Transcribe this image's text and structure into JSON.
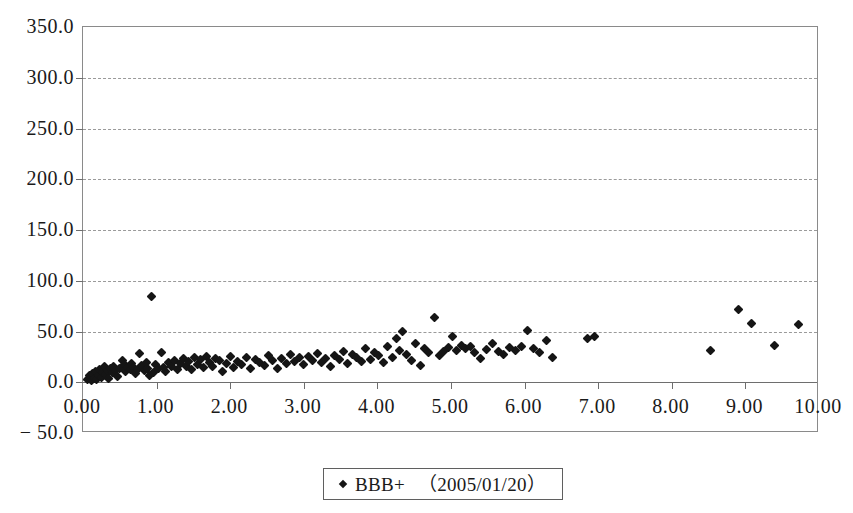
{
  "chart_data": {
    "type": "scatter",
    "title": "",
    "xlabel": "",
    "ylabel": "",
    "xlim": [
      0.0,
      10.0
    ],
    "ylim": [
      -50.0,
      350.0
    ],
    "grid": true,
    "grid_axis": "y",
    "legend_position": "bottom-center",
    "x_ticks": [
      "0.00",
      "1.00",
      "2.00",
      "3.00",
      "4.00",
      "5.00",
      "6.00",
      "7.00",
      "8.00",
      "9.00",
      "10.00"
    ],
    "x_tick_values": [
      0,
      1,
      2,
      3,
      4,
      5,
      6,
      7,
      8,
      9,
      10
    ],
    "y_ticks": [
      "350.0",
      "300.0",
      "250.0",
      "200.0",
      "150.0",
      "100.0",
      "50.0",
      "0.0",
      "− 50.0"
    ],
    "y_tick_values": [
      350,
      300,
      250,
      200,
      150,
      100,
      50,
      0,
      -50
    ],
    "series": [
      {
        "name": "BBB+",
        "date": "（2005/01/20）",
        "marker": "diamond",
        "color": "#151515",
        "points": [
          [
            0.06,
            3.0
          ],
          [
            0.09,
            6.5
          ],
          [
            0.11,
            1.5
          ],
          [
            0.13,
            9.0
          ],
          [
            0.15,
            4.0
          ],
          [
            0.17,
            11.0
          ],
          [
            0.19,
            2.5
          ],
          [
            0.21,
            7.0
          ],
          [
            0.23,
            13.0
          ],
          [
            0.25,
            5.0
          ],
          [
            0.27,
            10.0
          ],
          [
            0.29,
            15.5
          ],
          [
            0.31,
            8.0
          ],
          [
            0.33,
            12.0
          ],
          [
            0.35,
            3.5
          ],
          [
            0.37,
            14.0
          ],
          [
            0.4,
            9.5
          ],
          [
            0.42,
            16.0
          ],
          [
            0.44,
            11.5
          ],
          [
            0.47,
            6.0
          ],
          [
            0.5,
            13.5
          ],
          [
            0.53,
            21.0
          ],
          [
            0.56,
            17.0
          ],
          [
            0.58,
            10.5
          ],
          [
            0.61,
            14.5
          ],
          [
            0.64,
            12.5
          ],
          [
            0.66,
            18.0
          ],
          [
            0.69,
            15.0
          ],
          [
            0.72,
            8.5
          ],
          [
            0.74,
            13.0
          ],
          [
            0.77,
            28.0
          ],
          [
            0.8,
            16.5
          ],
          [
            0.83,
            12.0
          ],
          [
            0.86,
            19.0
          ],
          [
            0.88,
            14.0
          ],
          [
            0.91,
            6.5
          ],
          [
            0.93,
            84.0
          ],
          [
            0.96,
            10.0
          ],
          [
            0.99,
            17.5
          ],
          [
            1.02,
            13.5
          ],
          [
            1.06,
            29.0
          ],
          [
            1.09,
            15.0
          ],
          [
            1.12,
            11.0
          ],
          [
            1.16,
            19.5
          ],
          [
            1.2,
            16.0
          ],
          [
            1.24,
            21.5
          ],
          [
            1.28,
            13.0
          ],
          [
            1.32,
            18.5
          ],
          [
            1.36,
            23.0
          ],
          [
            1.4,
            15.5
          ],
          [
            1.44,
            20.0
          ],
          [
            1.48,
            12.5
          ],
          [
            1.52,
            24.0
          ],
          [
            1.56,
            17.0
          ],
          [
            1.6,
            22.0
          ],
          [
            1.64,
            14.5
          ],
          [
            1.68,
            25.5
          ],
          [
            1.72,
            19.0
          ],
          [
            1.76,
            16.0
          ],
          [
            1.8,
            23.5
          ],
          [
            1.85,
            21.0
          ],
          [
            1.9,
            10.5
          ],
          [
            1.95,
            18.0
          ],
          [
            2.0,
            25.0
          ],
          [
            2.05,
            15.0
          ],
          [
            2.1,
            20.5
          ],
          [
            2.16,
            17.5
          ],
          [
            2.22,
            24.5
          ],
          [
            2.28,
            13.5
          ],
          [
            2.34,
            22.5
          ],
          [
            2.4,
            19.5
          ],
          [
            2.46,
            16.5
          ],
          [
            2.52,
            26.0
          ],
          [
            2.58,
            21.5
          ],
          [
            2.64,
            14.0
          ],
          [
            2.7,
            23.0
          ],
          [
            2.76,
            18.5
          ],
          [
            2.82,
            27.0
          ],
          [
            2.88,
            20.0
          ],
          [
            2.94,
            24.0
          ],
          [
            3.0,
            17.0
          ],
          [
            3.06,
            25.5
          ],
          [
            3.12,
            21.0
          ],
          [
            3.18,
            28.5
          ],
          [
            3.24,
            19.0
          ],
          [
            3.3,
            23.5
          ],
          [
            3.36,
            16.0
          ],
          [
            3.42,
            26.5
          ],
          [
            3.48,
            22.0
          ],
          [
            3.54,
            30.0
          ],
          [
            3.6,
            18.0
          ],
          [
            3.66,
            27.5
          ],
          [
            3.72,
            24.5
          ],
          [
            3.78,
            20.5
          ],
          [
            3.84,
            33.0
          ],
          [
            3.9,
            22.5
          ],
          [
            3.96,
            29.0
          ],
          [
            4.02,
            26.0
          ],
          [
            4.08,
            19.5
          ],
          [
            4.14,
            35.0
          ],
          [
            4.2,
            24.0
          ],
          [
            4.26,
            43.0
          ],
          [
            4.3,
            31.0
          ],
          [
            4.34,
            50.0
          ],
          [
            4.4,
            27.0
          ],
          [
            4.46,
            21.5
          ],
          [
            4.52,
            38.0
          ],
          [
            4.58,
            16.5
          ],
          [
            4.64,
            33.5
          ],
          [
            4.7,
            29.5
          ],
          [
            4.78,
            64.0
          ],
          [
            4.84,
            26.5
          ],
          [
            4.9,
            30.0
          ],
          [
            4.96,
            34.0
          ],
          [
            5.02,
            45.0
          ],
          [
            5.08,
            31.5
          ],
          [
            5.14,
            36.0
          ],
          [
            5.2,
            33.0
          ],
          [
            5.26,
            35.5
          ],
          [
            5.32,
            29.0
          ],
          [
            5.4,
            23.0
          ],
          [
            5.48,
            32.0
          ],
          [
            5.56,
            38.5
          ],
          [
            5.64,
            30.5
          ],
          [
            5.72,
            27.5
          ],
          [
            5.8,
            34.5
          ],
          [
            5.88,
            31.0
          ],
          [
            5.96,
            35.0
          ],
          [
            6.04,
            51.0
          ],
          [
            6.12,
            33.5
          ],
          [
            6.2,
            29.5
          ],
          [
            6.3,
            41.0
          ],
          [
            6.38,
            24.5
          ],
          [
            6.85,
            43.0
          ],
          [
            6.95,
            45.5
          ],
          [
            8.52,
            31.0
          ],
          [
            8.9,
            72.0
          ],
          [
            9.08,
            58.0
          ],
          [
            9.4,
            36.5
          ],
          [
            9.72,
            57.0
          ]
        ]
      }
    ]
  }
}
